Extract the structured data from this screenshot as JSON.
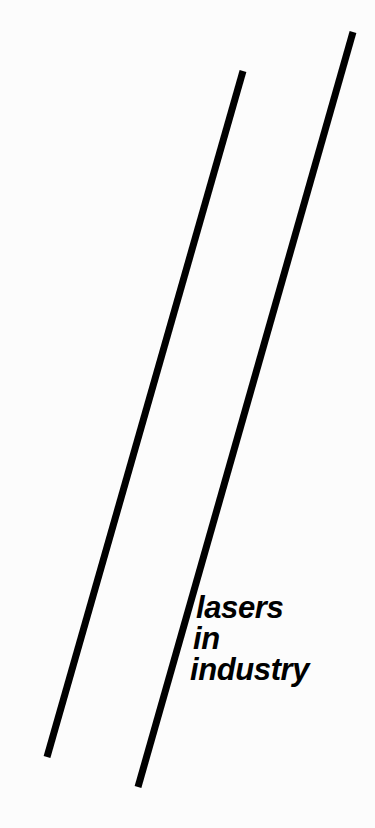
{
  "page": {
    "kind": "cover-artwork",
    "width": 375,
    "height": 828,
    "background_color": "#fcfcfc",
    "ink_color": "#000000"
  },
  "title": {
    "full_text": "lasers in industry",
    "lines": [
      {
        "text": "lasers"
      },
      {
        "text": "in"
      },
      {
        "text": "industry"
      }
    ],
    "style": "bold italic sans-serif",
    "color": "#000000"
  },
  "artwork": {
    "description": "two parallel diagonal black rules",
    "stroke_color": "#000000",
    "stroke_width": 7,
    "lines": [
      {
        "name": "left-diagonal-rule",
        "x1": 243,
        "y1": 71,
        "x2": 47,
        "y2": 757
      },
      {
        "name": "right-diagonal-rule",
        "x1": 353,
        "y1": 32,
        "x2": 138,
        "y2": 787
      }
    ]
  }
}
